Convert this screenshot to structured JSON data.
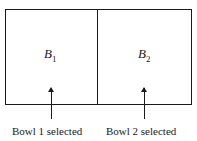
{
  "bowls": [
    {
      "letter": "B",
      "subscript": "1",
      "caption": "Bowl 1 selected"
    },
    {
      "letter": "B",
      "subscript": "2",
      "caption": "Bowl 2 selected"
    }
  ]
}
